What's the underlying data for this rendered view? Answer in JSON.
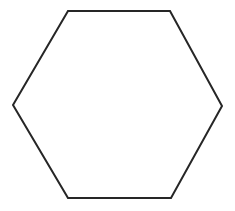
{
  "canvas": {
    "width": 235,
    "height": 211,
    "background_color": "#ffffff"
  },
  "figure": {
    "name": "hexagon",
    "description": "Hexagon outline",
    "shape_type": "hexagon",
    "sides": 6,
    "filled": false,
    "fill_color": "none",
    "stroke_color": "#262626",
    "stroke_width": 2,
    "orientation": "pointy-left-right",
    "vertices": [
      {
        "label": "left",
        "x": 13,
        "y": 105
      },
      {
        "label": "top-left",
        "x": 68,
        "y": 11
      },
      {
        "label": "top-right",
        "x": 170,
        "y": 11
      },
      {
        "label": "right",
        "x": 222,
        "y": 106
      },
      {
        "label": "bottom-right",
        "x": 171,
        "y": 198
      },
      {
        "label": "bottom-left",
        "x": 68,
        "y": 198
      }
    ],
    "points_attr": "13,105 68,11 170,11 222,106 171,198 68,198"
  }
}
